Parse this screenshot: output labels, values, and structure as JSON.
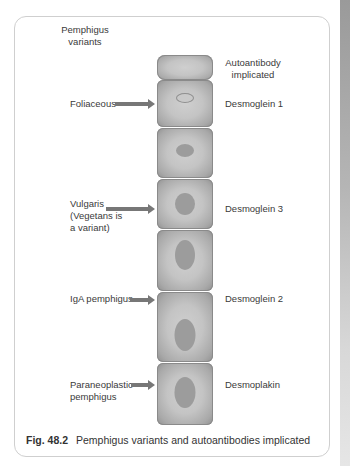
{
  "headers": {
    "left": "Pemphigus variants",
    "left_lines": [
      "Pemphigus",
      "variants"
    ],
    "right_lines": [
      "Autoantibody",
      "implicated"
    ]
  },
  "rows": [
    {
      "variant_lines": [
        "Foliaceous"
      ],
      "autoantibody": "Desmoglein 1"
    },
    {
      "variant_lines": [
        "Vulgaris",
        "(Vegetans is",
        "a variant)"
      ],
      "autoantibody": "Desmoglein 3"
    },
    {
      "variant_lines": [
        "IgA pemphigus"
      ],
      "autoantibody": "Desmoglein 2"
    },
    {
      "variant_lines": [
        "Paraneoplastic",
        "pemphigus"
      ],
      "autoantibody": "Desmoplakin"
    }
  ],
  "caption": {
    "number": "Fig. 48.2",
    "text": "Pemphigus variants and autoantibodies implicated"
  },
  "colors": {
    "cell_fill": "#c4c4c4",
    "nucleus": "#9c9c9c",
    "arrow": "#777777",
    "frame": "#cfcfcf"
  }
}
